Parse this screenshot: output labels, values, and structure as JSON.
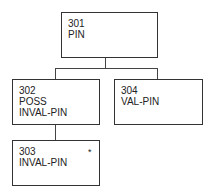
{
  "diagram": {
    "type": "tree",
    "nodes": [
      {
        "id": "301",
        "lines": [
          "301",
          "PIN"
        ]
      },
      {
        "id": "302",
        "lines": [
          "302",
          "POSS",
          "INVAL-PIN"
        ]
      },
      {
        "id": "303",
        "lines": [
          "303",
          "INVAL-PIN"
        ],
        "marker": "*"
      },
      {
        "id": "304",
        "lines": [
          "304",
          "VAL-PIN"
        ]
      }
    ],
    "edges": [
      {
        "from": "301",
        "to": "302"
      },
      {
        "from": "301",
        "to": "304"
      },
      {
        "from": "302",
        "to": "303"
      }
    ]
  }
}
